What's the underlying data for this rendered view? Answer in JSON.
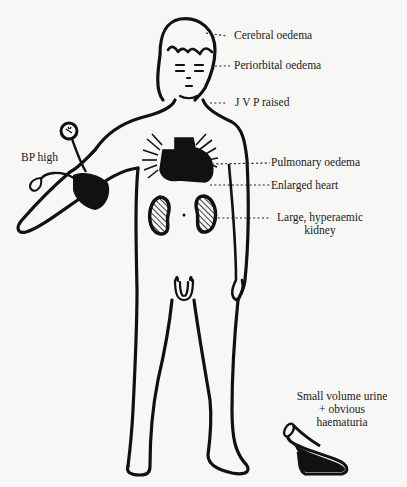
{
  "figure": {
    "labels": {
      "cerebral": "Cerebral oedema",
      "periorbital": "Periorbital oedema",
      "jvp": "J V P raised",
      "bp": "BP high",
      "pulmonary": "Pulmonary oedema",
      "heart": "Enlarged heart",
      "kidney_line1": "Large, hyperaemic",
      "kidney_line2": "kidney",
      "urine_line1": "Small volume urine",
      "urine_line2": "+ obvious",
      "urine_line3": "haematuria"
    },
    "colors": {
      "ink": "#111111",
      "paper": "#f7f7f5"
    }
  }
}
